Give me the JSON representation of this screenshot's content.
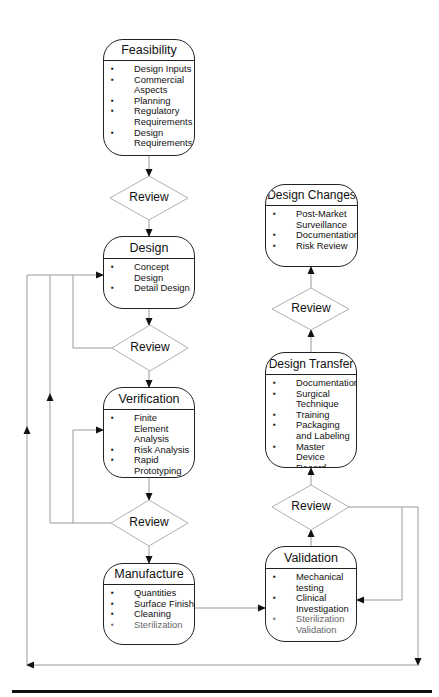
{
  "nodes": {
    "feasibility": {
      "title": "Feasibility",
      "items": [
        {
          "text": "Design Inputs"
        },
        {
          "text": "Commercial Aspects"
        },
        {
          "text": "Planning"
        },
        {
          "text": "Regulatory Requirements"
        },
        {
          "text": "Design Requirements"
        }
      ]
    },
    "design": {
      "title": "Design",
      "items": [
        {
          "text": "Concept Design"
        },
        {
          "text": "Detail Design"
        }
      ]
    },
    "verification": {
      "title": "Verification",
      "items": [
        {
          "text": "Finite Element Analysis"
        },
        {
          "text": "Risk Analysis"
        },
        {
          "text": "Rapid Prototyping"
        }
      ]
    },
    "manufacture": {
      "title": "Manufacture",
      "items": [
        {
          "text": "Quantities"
        },
        {
          "text": "Surface Finish"
        },
        {
          "text": "Cleaning"
        },
        {
          "text": "Sterilization"
        }
      ]
    },
    "validation": {
      "title": "Validation",
      "items": [
        {
          "text": "Mechanical testing"
        },
        {
          "text": "Clinical Investigation"
        },
        {
          "text": "Sterilization Validation"
        }
      ]
    },
    "design_transfer": {
      "title": "Design Transfer",
      "items": [
        {
          "text": "Documentation"
        },
        {
          "text": "Surgical Technique"
        },
        {
          "text": "Training"
        },
        {
          "text": "Packaging and Labeling"
        },
        {
          "text": "Master Device Record"
        }
      ]
    },
    "design_changes": {
      "title": "Design Changes",
      "items": [
        {
          "text": "Post-Market Surveillance"
        },
        {
          "text": "Documentation"
        },
        {
          "text": "Risk Review"
        }
      ]
    }
  },
  "decisions": {
    "review_1": "Review",
    "review_2": "Review",
    "review_3": "Review",
    "review_4": "Review",
    "review_5": "Review"
  },
  "colors": {
    "box_border": "#222222",
    "connector": "#9a9a9a",
    "diamond_border": "#b0b0b0",
    "arrowhead": "#111111"
  }
}
